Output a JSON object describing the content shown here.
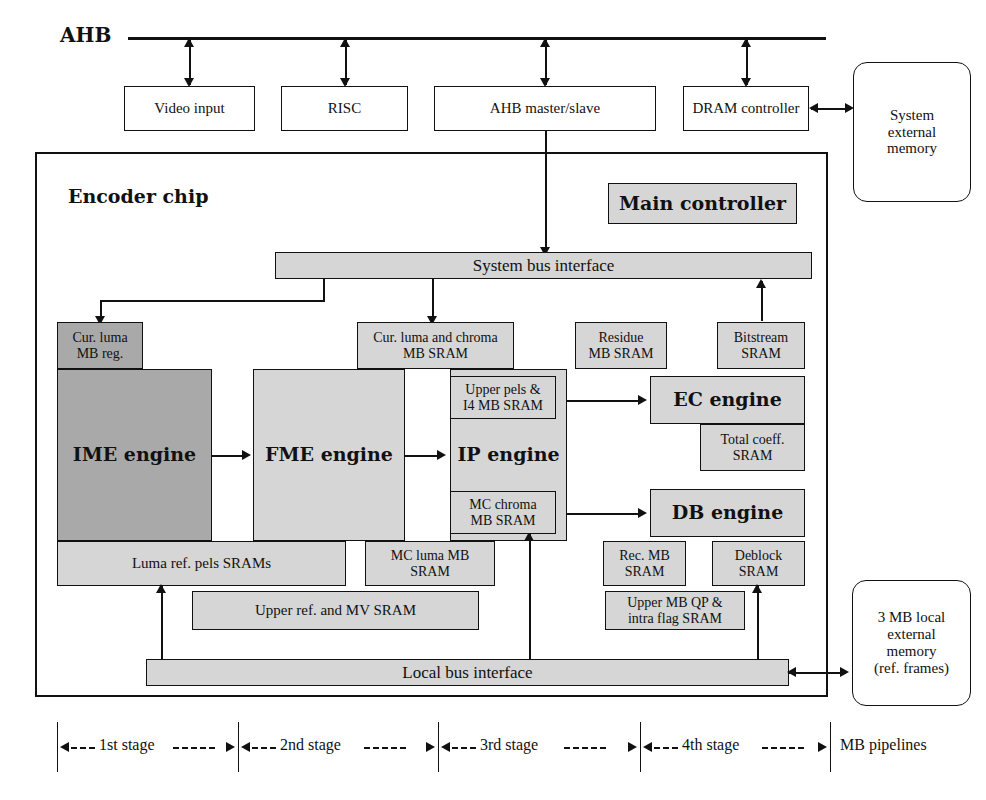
{
  "diagram": {
    "bus_label": "AHB",
    "chip_label": "Encoder chip",
    "pipeline_caption": "MB pipelines"
  },
  "colors": {
    "dark_gray": "#a9a9a9",
    "light_gray": "#d6d6d6",
    "white": "#ffffff",
    "line": "#111111"
  },
  "ahb_blocks": [
    {
      "label": "Video input"
    },
    {
      "label": "RISC"
    },
    {
      "label": "AHB master/slave"
    },
    {
      "label": "DRAM controller"
    }
  ],
  "external": {
    "system_memory": "System\nexternal\nmemory",
    "local_memory": "3 MB local\nexternal\nmemory\n(ref. frames)"
  },
  "chip": {
    "main_controller": "Main controller",
    "system_bus_interface": "System bus interface",
    "local_bus_interface": "Local bus interface"
  },
  "engines": [
    {
      "label": "IME engine",
      "shade": "dark"
    },
    {
      "label": "FME engine",
      "shade": "light"
    },
    {
      "label": "IP engine",
      "shade": "light"
    },
    {
      "label": "EC engine",
      "shade": "light"
    },
    {
      "label": "DB engine",
      "shade": "light"
    }
  ],
  "memories": [
    {
      "label": "Cur. luma\nMB reg.",
      "shade": "dark"
    },
    {
      "label": "Cur. luma and chroma\nMB SRAM",
      "shade": "light"
    },
    {
      "label": "Residue\nMB SRAM",
      "shade": "light"
    },
    {
      "label": "Bitstream\nSRAM",
      "shade": "light"
    },
    {
      "label": "Upper pels &\nI4 MB SRAM",
      "shade": "light"
    },
    {
      "label": "MC chroma\nMB SRAM",
      "shade": "light"
    },
    {
      "label": "Total coeff.\nSRAM",
      "shade": "light"
    },
    {
      "label": "Luma ref. pels SRAMs",
      "shade": "light"
    },
    {
      "label": "MC luma MB\nSRAM",
      "shade": "light"
    },
    {
      "label": "Rec. MB\nSRAM",
      "shade": "light"
    },
    {
      "label": "Deblock\nSRAM",
      "shade": "light"
    },
    {
      "label": "Upper ref. and MV SRAM",
      "shade": "light"
    },
    {
      "label": "Upper MB QP &\nintra flag SRAM",
      "shade": "light"
    }
  ],
  "pipeline_stages": [
    {
      "label": "1st stage"
    },
    {
      "label": "2nd stage"
    },
    {
      "label": "3rd stage"
    },
    {
      "label": "4th stage"
    }
  ]
}
